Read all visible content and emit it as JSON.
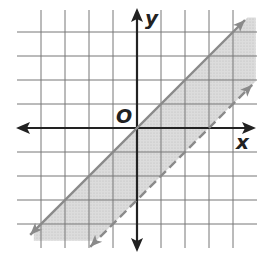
{
  "chart_data": {
    "type": "line",
    "title": "",
    "xlabel": "x",
    "ylabel": "y",
    "origin_label": "O",
    "xlim": [
      -4.5,
      5
    ],
    "ylim": [
      -5,
      4.5
    ],
    "grid": true,
    "grid_step": 1,
    "series": [
      {
        "name": "boundary-solid",
        "equation": "y = x",
        "style": "solid",
        "points": [
          [
            -4.5,
            -4.5
          ],
          [
            4.5,
            4.5
          ]
        ]
      },
      {
        "name": "boundary-dashed",
        "equation": "y = x - 3",
        "style": "dashed",
        "points": [
          [
            -1.8,
            -4.8
          ],
          [
            5,
            2
          ]
        ]
      }
    ],
    "shaded_region": "x - 3 < y <= x",
    "colors": {
      "grid": "#777777",
      "axes": "#222222",
      "boundary": "#8a8a8a",
      "shading": "#d6d6d6"
    }
  },
  "labels": {
    "x_axis": "x",
    "y_axis": "y",
    "origin": "O"
  }
}
